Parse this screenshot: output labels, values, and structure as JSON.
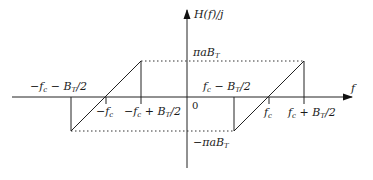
{
  "diagram": {
    "title": "",
    "axes": {
      "x_label": "f",
      "y_label": "H(f)/j",
      "origin_label": "0"
    },
    "levels": {
      "top": "πaB",
      "top_sub": "T",
      "bottom": "−πaB",
      "bottom_sub": "T"
    },
    "tick_labels": {
      "neg_outer_a": "−f",
      "neg_outer_a_sub": "c",
      "neg_outer_b": " − B",
      "neg_outer_b_sub": "T",
      "neg_outer_c": "/2",
      "neg_center": "−f",
      "neg_center_sub": "c",
      "neg_inner_a": "−f",
      "neg_inner_a_sub": "c",
      "neg_inner_b": " + B",
      "neg_inner_b_sub": "T",
      "neg_inner_c": "/2",
      "pos_inner_a": "f",
      "pos_inner_a_sub": "c",
      "pos_inner_b": " − B",
      "pos_inner_b_sub": "T",
      "pos_inner_c": "/2",
      "pos_center": "f",
      "pos_center_sub": "c",
      "pos_outer_a": "f",
      "pos_outer_a_sub": "c",
      "pos_outer_b": " + B",
      "pos_outer_b_sub": "T",
      "pos_outer_c": "/2"
    },
    "segments": [
      {
        "name": "negative-band-ramp",
        "from": [
          -1.5,
          -1
        ],
        "to": [
          -0.5,
          1
        ]
      },
      {
        "name": "positive-band-ramp",
        "from": [
          0.5,
          -1
        ],
        "to": [
          1.5,
          1
        ]
      }
    ]
  }
}
